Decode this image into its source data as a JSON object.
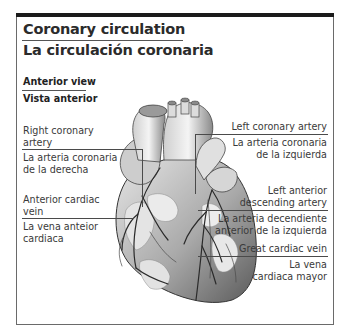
{
  "title": {
    "english": "Coronary circulation",
    "spanish": "La circulación coronaria"
  },
  "view": {
    "english": "Anterior view",
    "spanish": "Vista anterior"
  },
  "labels": {
    "left_side": [
      {
        "english_1": "Right coronary",
        "english_2": "artery",
        "spanish_1": "La arteria coronaria",
        "spanish_2": "de la derecha"
      },
      {
        "english_1": "Anterior cardiac",
        "english_2": "vein",
        "spanish_1": "La vena anteior",
        "spanish_2": "cardiaca"
      }
    ],
    "right_side": [
      {
        "english_1": "Left coronary artery",
        "spanish_1": "La arteria coronaria",
        "spanish_2": "de la izquierda"
      },
      {
        "english_1": "Left anterior",
        "english_2": "descending artery",
        "spanish_1": "La arteria decendiente",
        "spanish_2": "anterior de la izquierda"
      },
      {
        "english_1": "Great cardiac vein",
        "spanish_1": "La vena",
        "spanish_2": "cardiaca mayor"
      }
    ]
  },
  "colors": {
    "frame": "#6a6a6a",
    "top_bar": "#1b1b1b",
    "text": "#2b2b2b",
    "leader_lines": "#4a4a4a"
  }
}
